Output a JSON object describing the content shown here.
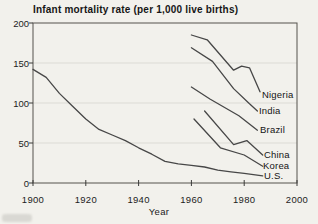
{
  "chart_data": {
    "type": "line",
    "title": "Infant mortality rate (per 1,000 live births)",
    "xlabel": "Year",
    "ylabel": "",
    "xlim": [
      1900,
      2000
    ],
    "ylim": [
      0,
      200
    ],
    "xticks": [
      1900,
      1920,
      1940,
      1960,
      1980,
      2000
    ],
    "yticks": [
      0,
      50,
      100,
      150,
      200
    ],
    "grid": "horizontal-light",
    "legend_position": "inline-right-labels",
    "series": [
      {
        "name": "Nigeria",
        "points": [
          [
            1960,
            185
          ],
          [
            1966,
            179
          ],
          [
            1976,
            141
          ],
          [
            1979,
            146
          ],
          [
            1982,
            144
          ],
          [
            1986,
            114
          ]
        ],
        "label_pos": [
          262,
          90
        ]
      },
      {
        "name": "India",
        "points": [
          [
            1960,
            169
          ],
          [
            1968,
            152
          ],
          [
            1976,
            118
          ],
          [
            1982,
            99
          ],
          [
            1985,
            90
          ]
        ],
        "label_pos": [
          259,
          106
        ]
      },
      {
        "name": "Brazil",
        "points": [
          [
            1960,
            120
          ],
          [
            1967,
            105
          ],
          [
            1978,
            84
          ],
          [
            1985,
            66
          ]
        ],
        "label_pos": [
          260,
          125
        ]
      },
      {
        "name": "China",
        "points": [
          [
            1965,
            90
          ],
          [
            1976,
            48
          ],
          [
            1981,
            53
          ],
          [
            1987,
            35
          ]
        ],
        "label_pos": [
          264,
          150
        ]
      },
      {
        "name": "Korea",
        "points": [
          [
            1961,
            80
          ],
          [
            1971,
            44
          ],
          [
            1980,
            35
          ],
          [
            1987,
            21
          ]
        ],
        "label_pos": [
          263,
          161
        ]
      },
      {
        "name": "U.S.",
        "points": [
          [
            1900,
            142
          ],
          [
            1905,
            132
          ],
          [
            1910,
            112
          ],
          [
            1915,
            96
          ],
          [
            1920,
            80
          ],
          [
            1925,
            67
          ],
          [
            1930,
            60
          ],
          [
            1935,
            53
          ],
          [
            1940,
            44
          ],
          [
            1945,
            36
          ],
          [
            1950,
            27
          ],
          [
            1955,
            24
          ],
          [
            1960,
            22
          ],
          [
            1965,
            20
          ],
          [
            1970,
            16
          ],
          [
            1975,
            14
          ],
          [
            1980,
            12
          ],
          [
            1987,
            9
          ]
        ],
        "label_pos": [
          264,
          171
        ]
      }
    ],
    "colors": {
      "line": "#474747",
      "grid": "#dcdbd5",
      "frame": "#55524c",
      "tick": "#3a3a38",
      "text": "#1c1c1c",
      "background": "#f2f1ec"
    }
  }
}
